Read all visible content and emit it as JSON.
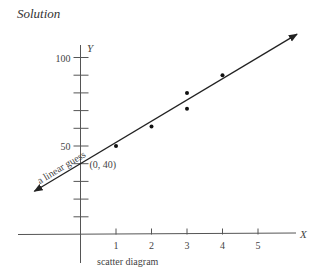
{
  "heading": "Solution",
  "chart_data": {
    "type": "scatter",
    "title": "Solution",
    "caption": "scatter diagram",
    "xlabel": "X",
    "ylabel": "Y",
    "xlim": [
      -2,
      6
    ],
    "ylim": [
      0,
      105
    ],
    "x_ticks": [
      1,
      2,
      3,
      4,
      5
    ],
    "x_tick_labels": [
      "1",
      "2",
      "3",
      "4",
      "5"
    ],
    "y_ticks": [
      10,
      20,
      30,
      40,
      50,
      60,
      70,
      80,
      90,
      100
    ],
    "y_tick_labels": {
      "50": "50",
      "100": "100"
    },
    "grid": false,
    "points": [
      {
        "x": 1,
        "y": 50
      },
      {
        "x": 2,
        "y": 61
      },
      {
        "x": 3,
        "y": 71
      },
      {
        "x": 3,
        "y": 80
      },
      {
        "x": 4,
        "y": 90
      }
    ],
    "fit_line": {
      "label": "a linear guess",
      "intercept": 40,
      "slope": 12,
      "x_range": [
        -1.3,
        6.1
      ]
    },
    "annotations": [
      {
        "text": "(0, 40)",
        "x": 0,
        "y": 40
      }
    ]
  }
}
